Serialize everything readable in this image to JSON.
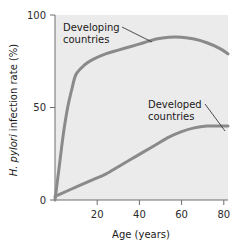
{
  "chart_data": {
    "type": "line",
    "title": "",
    "xlabel": "Age (years)",
    "ylabel": "H. pylori infection rate (%)",
    "ylabel_italic_part": "H. pylori",
    "ylabel_rest": " infection rate (%)",
    "xlim": [
      0,
      82
    ],
    "ylim": [
      0,
      100
    ],
    "xticks": [
      20,
      40,
      60,
      80
    ],
    "xtick_labels": [
      "20",
      "40",
      "60",
      "80"
    ],
    "yticks": [
      0,
      50,
      100
    ],
    "ytick_labels": [
      "0",
      "50",
      "100"
    ],
    "grid": false,
    "legend_position": "inline-annotations",
    "line_color": "#8a8a8a",
    "plot_background": "#ebebeb",
    "series": [
      {
        "name": "Developing countries",
        "label_line1": "Developing",
        "label_line2": "countries",
        "x": [
          0,
          2,
          4,
          6,
          8,
          10,
          14,
          18,
          24,
          30,
          36,
          42,
          48,
          54,
          60,
          66,
          72,
          78,
          82
        ],
        "values": [
          0,
          18,
          36,
          50,
          60,
          68,
          73,
          76,
          79,
          81,
          83,
          85,
          87,
          88,
          88,
          87,
          85,
          82,
          79
        ]
      },
      {
        "name": "Developed countries",
        "label_line1": "Developed",
        "label_line2": "countries",
        "x": [
          0,
          6,
          12,
          18,
          24,
          30,
          36,
          42,
          48,
          54,
          60,
          66,
          72,
          78,
          82
        ],
        "values": [
          2,
          5,
          8,
          11,
          14,
          18,
          22,
          26,
          30,
          34,
          37,
          39,
          40,
          40,
          40
        ]
      }
    ],
    "annotations": [
      {
        "name": "developing-countries-annotation",
        "text_line1": "Developing",
        "text_line2": "countries",
        "leader_from": [
          96,
          27
        ],
        "leader_to": [
          150,
          40
        ]
      },
      {
        "name": "developed-countries-annotation",
        "text_line1": "Developed",
        "text_line2": "countries",
        "leader_from": [
          195,
          104
        ],
        "leader_to": [
          223,
          133
        ]
      }
    ]
  }
}
